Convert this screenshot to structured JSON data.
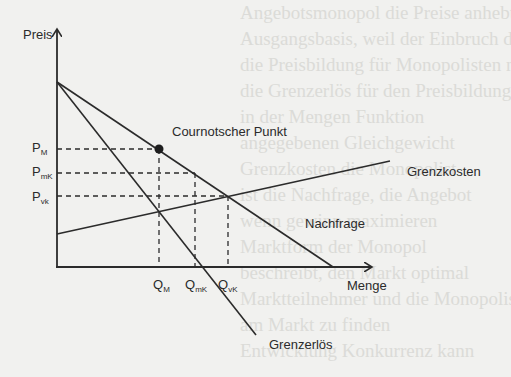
{
  "diagram": {
    "type": "economics-monopoly-cournot",
    "axes": {
      "y_label": "Preis",
      "x_label": "Menge"
    },
    "curves": {
      "demand": "Nachfrage",
      "marginal_revenue": "Grenzerlös",
      "marginal_cost": "Grenzkosten"
    },
    "point": {
      "label": "Cournotscher Punkt"
    },
    "price_ticks": [
      {
        "main": "P",
        "sub": "M"
      },
      {
        "main": "P",
        "sub": "mK"
      },
      {
        "main": "P",
        "sub": "vk"
      }
    ],
    "quantity_ticks": [
      {
        "main": "Q",
        "sub": "M"
      },
      {
        "main": "Q",
        "sub": "mK"
      },
      {
        "main": "Q",
        "sub": "vK"
      }
    ],
    "colors": {
      "line": "#2b2b2b",
      "background": "#f1f1ef"
    }
  },
  "background_text": [
    "Angebotsmonopol die Preise anhebt",
    "Ausgangsbasis, weil der Einbruch der Nachfrage",
    "die Preisbildung für Monopolisten nicht",
    "die Grenzerlös für den Preisbildungsvorgang",
    "in der Mengen Funktion",
    "angegebenen Gleichgewicht",
    "Grenzkosten die Monopolist",
    "ist die Nachfrage, die Angebot",
    "wenn gewinn maximieren",
    "Marktform der Monopol",
    "beschreibt, den Markt optimal",
    "Marktteilnehmer und die Monopolisten",
    "am Markt zu finden",
    "Entwicklung Konkurrenz kann"
  ]
}
